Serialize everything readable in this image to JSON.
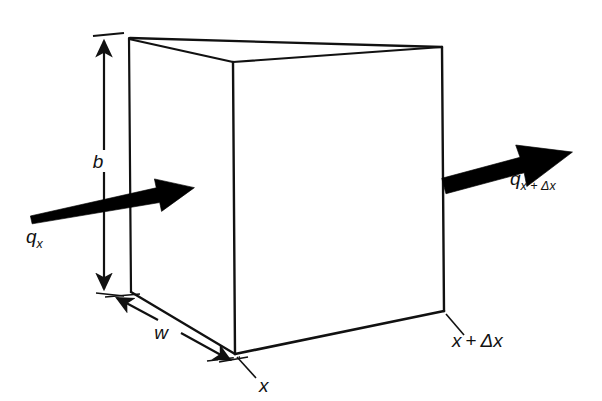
{
  "figure": {
    "type": "engineering-diagram",
    "background_color": "#ffffff",
    "line_color": "#111111",
    "arrow_color": "#000000"
  },
  "labels": {
    "height_dimension": "b",
    "width_dimension": "w",
    "flux_in_symbol": "q",
    "flux_in_subscript": "x",
    "flux_out_symbol": "q",
    "flux_out_subscript": "x + Δx",
    "position_left": "x",
    "position_right": "x + Δx",
    "position_right_var": "x",
    "position_right_op": "+",
    "position_right_delta": "Δx"
  },
  "geometry": {
    "cube": {
      "front_top_left": [
        129,
        38
      ],
      "front_top_right": [
        233,
        62
      ],
      "back_top_right": [
        442,
        47
      ],
      "back_top_left": [
        130,
        38
      ],
      "front_bottom_left": [
        131,
        292
      ],
      "front_bottom_mid": [
        235,
        354
      ],
      "front_bottom_right": [
        444,
        311
      ],
      "right_top": [
        442,
        47
      ],
      "right_bottom": [
        444,
        311
      ]
    },
    "height_arrow": {
      "x": 104,
      "y_top": 40,
      "y_bottom": 290
    },
    "width_arrow": {
      "start": [
        116,
        297
      ],
      "end": [
        231,
        361
      ]
    },
    "flux_in_arrow": {
      "start": [
        30,
        212
      ],
      "end": [
        196,
        192
      ]
    },
    "flux_out_arrow": {
      "start": [
        444,
        183
      ],
      "end": [
        577,
        143
      ]
    }
  }
}
